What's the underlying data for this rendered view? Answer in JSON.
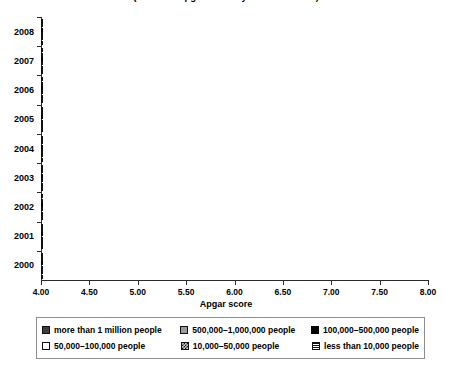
{
  "chart": {
    "title": "(Neonatal Apgar Score by Year 2000-2008)",
    "xlabel": "Apgar score",
    "ylabel": ""
  },
  "xaxis": {
    "ticks": [
      "4.00",
      "4.50",
      "5.00",
      "5.50",
      "6.00",
      "6.50",
      "7.00",
      "7.50",
      "8.00"
    ]
  },
  "legend": {
    "items": [
      {
        "label": "more than 1 million people",
        "swatch": "dark-gray-swatch"
      },
      {
        "label": "500,000–1,000,000 people",
        "swatch": "mid-gray-swatch"
      },
      {
        "label": "100,000–500,000 people",
        "swatch": "black-swatch"
      },
      {
        "label": "50,000–100,000 people",
        "swatch": "white-swatch"
      },
      {
        "label": "10,000–50,000 people",
        "swatch": "crosshatch-swatch"
      },
      {
        "label": "less than 10,000 people",
        "swatch": "horizontal-lines-swatch"
      }
    ]
  },
  "chart_data": {
    "type": "bar",
    "orientation": "horizontal",
    "title": "(Neonatal Apgar Score by Year 2000-2008)",
    "xlabel": "Apgar score",
    "ylabel": "",
    "xlim": [
      4.0,
      8.0
    ],
    "xticks": [
      4.0,
      4.5,
      5.0,
      5.5,
      6.0,
      6.5,
      7.0,
      7.5,
      8.0
    ],
    "grid": false,
    "legend_position": "bottom",
    "categories": [
      "2000",
      "2001",
      "2002",
      "2003",
      "2004",
      "2005",
      "2006",
      "2007",
      "2008"
    ],
    "series": [
      {
        "name": "more than 1 million people",
        "values": [
          5.95,
          6.15,
          6.35,
          6.45,
          6.45,
          6.5,
          6.75,
          6.6,
          6.85
        ]
      },
      {
        "name": "500,000–1,000,000 people",
        "values": [
          6.45,
          6.55,
          6.65,
          6.7,
          6.75,
          6.8,
          6.95,
          6.85,
          7.1
        ]
      },
      {
        "name": "100,000–500,000 people",
        "values": [
          6.6,
          6.8,
          6.9,
          6.85,
          6.85,
          6.95,
          7.05,
          7.0,
          7.25
        ]
      },
      {
        "name": "50,000–100,000 people",
        "values": [
          7.0,
          7.05,
          7.05,
          7.2,
          7.0,
          7.0,
          7.0,
          7.1,
          7.35
        ]
      },
      {
        "name": "10,000–50,000 people",
        "values": [
          6.25,
          6.3,
          6.75,
          6.4,
          6.5,
          6.55,
          6.75,
          6.75,
          7.4
        ]
      },
      {
        "name": "less than 10,000 people",
        "values": [
          5.75,
          5.55,
          5.75,
          5.6,
          5.85,
          5.4,
          5.8,
          5.7,
          6.4
        ]
      }
    ]
  }
}
